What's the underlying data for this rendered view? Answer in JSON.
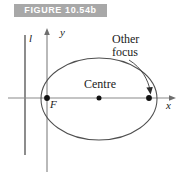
{
  "figure": {
    "banner_label": "FIGURE 10.54b",
    "banner_color": "#a8a8a8",
    "banner_text_color": "#ffffff",
    "background_color": "#ffffff",
    "stroke_color": "#6e6e6e",
    "curve_color": "#555555",
    "dot_color": "#111111",
    "text_color": "#1a1a1a"
  },
  "labels": {
    "other_focus_line1": "Other",
    "other_focus_line2": "focus",
    "centre": "Centre",
    "focus_F": "F",
    "axis_x": "x",
    "axis_y": "y",
    "directrix": "l"
  },
  "geometry": {
    "x_axis_y": 98,
    "y_axis_x": 47,
    "directrix_x": 25,
    "ellipse_center_x": 99,
    "ellipse_center_y": 99,
    "ellipse_rx": 58,
    "ellipse_ry": 41,
    "focus_left_x": 47,
    "focus_right_x": 149,
    "centre_dot_x": 99
  }
}
